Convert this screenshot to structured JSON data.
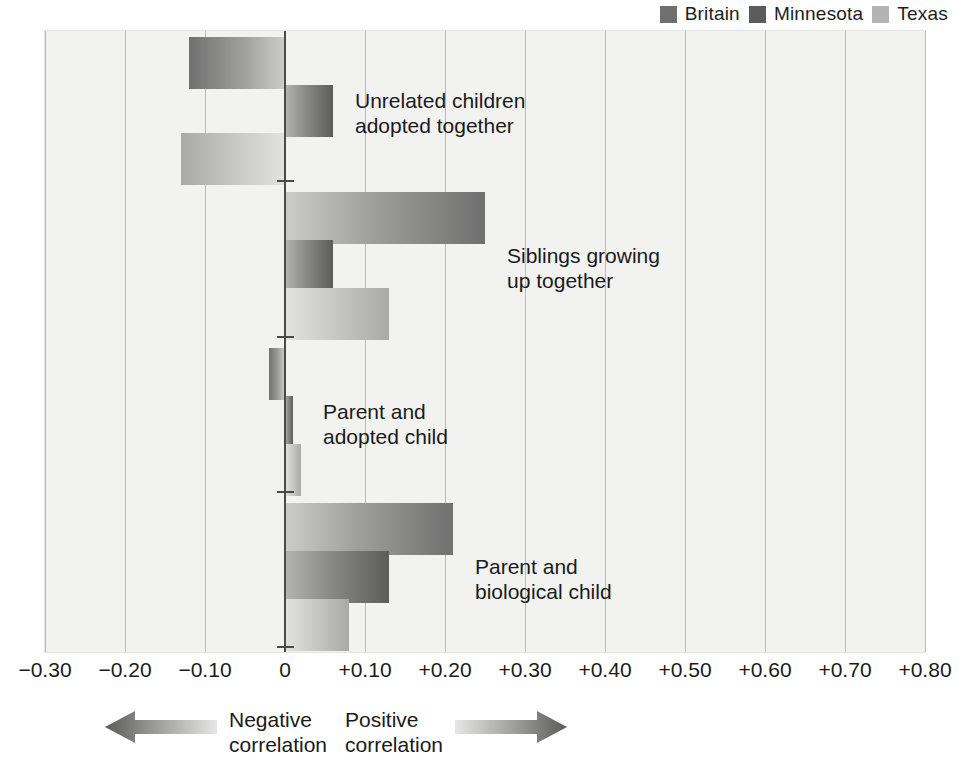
{
  "legend": {
    "items": [
      {
        "label": "Britain",
        "color": "#707070",
        "icon": "legend-swatch-icon"
      },
      {
        "label": "Minnesota",
        "color": "#5c5c5c",
        "icon": "legend-swatch-icon"
      },
      {
        "label": "Texas",
        "color": "#b3b3b1",
        "icon": "legend-swatch-icon"
      }
    ]
  },
  "footer": {
    "negative": {
      "label": "Negative\ncorrelation",
      "icon": "arrow-left-icon"
    },
    "positive": {
      "label": "Positive\ncorrelation",
      "icon": "arrow-right-icon"
    }
  },
  "chart_data": {
    "type": "bar",
    "orientation": "horizontal",
    "title": "",
    "xlabel": "",
    "ylabel": "",
    "xlim": [
      -0.3,
      0.8
    ],
    "xticks": [
      -0.3,
      -0.2,
      -0.1,
      0,
      0.1,
      0.2,
      0.3,
      0.4,
      0.5,
      0.6,
      0.7,
      0.8
    ],
    "xtick_labels": [
      "−0.30",
      "−0.20",
      "−0.10",
      "0",
      "+0.10",
      "+0.20",
      "+0.30",
      "+0.40",
      "+0.50",
      "+0.60",
      "+0.70",
      "+0.80"
    ],
    "grid": true,
    "legend_position": "top-right",
    "categories": [
      "Unrelated children\nadopted together",
      "Siblings growing\nup together",
      "Parent and\nadopted child",
      "Parent and\nbiological child"
    ],
    "series": [
      {
        "name": "Britain",
        "values": [
          -0.12,
          0.25,
          -0.02,
          0.21
        ]
      },
      {
        "name": "Minnesota",
        "values": [
          0.06,
          0.06,
          0.01,
          0.13
        ]
      },
      {
        "name": "Texas",
        "values": [
          -0.13,
          0.13,
          0.02,
          0.08
        ]
      }
    ]
  }
}
